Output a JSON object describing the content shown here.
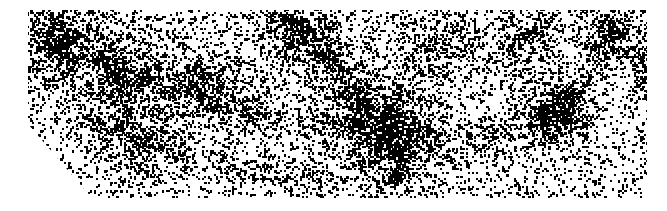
{
  "image": {
    "description": "Black-and-white point density map resembling a slice of large-scale galaxy distribution",
    "width": 667,
    "height": 211,
    "background": "#ffffff",
    "ink": "#000000",
    "outline_polygon": [
      [
        28,
        10
      ],
      [
        647,
        10
      ],
      [
        647,
        198
      ],
      [
        92,
        198
      ],
      [
        28,
        124
      ]
    ],
    "background_density": 0.16,
    "clusters": [
      {
        "x": 385,
        "y": 130,
        "r": 30,
        "strength": 0.75
      },
      {
        "x": 555,
        "y": 110,
        "r": 20,
        "strength": 0.7
      },
      {
        "x": 60,
        "y": 40,
        "r": 28,
        "strength": 0.5
      },
      {
        "x": 130,
        "y": 80,
        "r": 30,
        "strength": 0.45
      },
      {
        "x": 290,
        "y": 20,
        "r": 22,
        "strength": 0.45
      },
      {
        "x": 215,
        "y": 95,
        "r": 26,
        "strength": 0.4
      },
      {
        "x": 610,
        "y": 25,
        "r": 18,
        "strength": 0.45
      },
      {
        "x": 640,
        "y": 75,
        "r": 14,
        "strength": 0.4
      },
      {
        "x": 440,
        "y": 40,
        "r": 25,
        "strength": 0.35
      },
      {
        "x": 520,
        "y": 40,
        "r": 22,
        "strength": 0.35
      },
      {
        "x": 130,
        "y": 150,
        "r": 22,
        "strength": 0.35
      },
      {
        "x": 330,
        "y": 60,
        "r": 24,
        "strength": 0.3
      }
    ],
    "filaments": [
      [
        [
          40,
          30
        ],
        [
          120,
          70
        ],
        [
          200,
          90
        ],
        [
          260,
          115
        ],
        [
          340,
          125
        ],
        [
          385,
          130
        ]
      ],
      [
        [
          385,
          130
        ],
        [
          450,
          150
        ],
        [
          520,
          130
        ],
        [
          555,
          110
        ]
      ],
      [
        [
          555,
          110
        ],
        [
          580,
          80
        ],
        [
          610,
          25
        ]
      ],
      [
        [
          290,
          20
        ],
        [
          330,
          60
        ],
        [
          385,
          130
        ]
      ],
      [
        [
          385,
          130
        ],
        [
          400,
          175
        ],
        [
          410,
          198
        ]
      ],
      [
        [
          90,
          120
        ],
        [
          160,
          150
        ],
        [
          250,
          170
        ],
        [
          320,
          185
        ]
      ]
    ]
  }
}
